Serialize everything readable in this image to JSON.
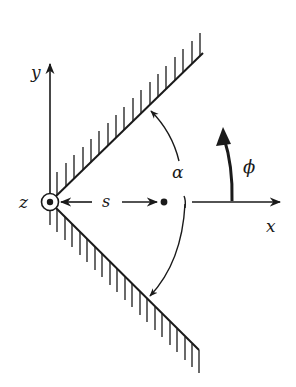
{
  "diagram": {
    "labels": {
      "y_axis": "y",
      "x_axis": "x",
      "z_axis": "z",
      "distance": "s",
      "wedge_angle": "α",
      "azimuth_angle": "ϕ"
    },
    "colors": {
      "ink": "#1a1a1a",
      "background": "#ffffff"
    },
    "elements": [
      {
        "name": "upper-wall",
        "type": "hatched-plane",
        "hatch": "up"
      },
      {
        "name": "lower-wall",
        "type": "hatched-plane",
        "hatch": "down"
      },
      {
        "name": "z-axis-out-of-page",
        "type": "circled-dot"
      },
      {
        "name": "point-charge",
        "type": "dot"
      },
      {
        "name": "alpha-arc",
        "type": "double-arrow-arc"
      },
      {
        "name": "phi-arrow",
        "type": "curved-arrow"
      }
    ]
  }
}
